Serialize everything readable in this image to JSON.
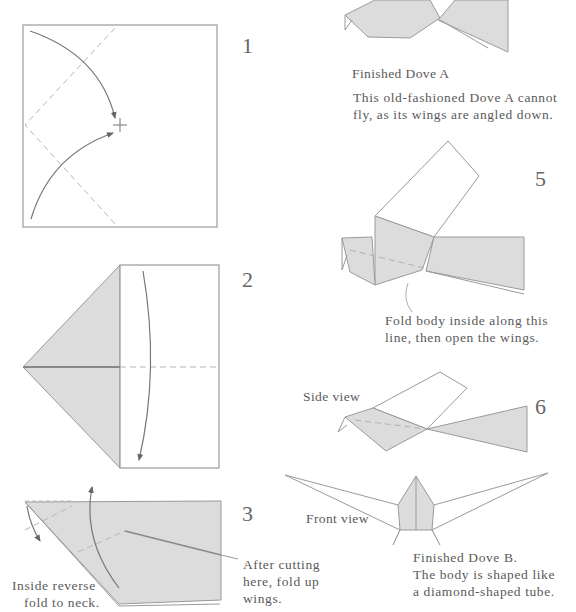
{
  "colors": {
    "paper_fill": "#dcdcdc",
    "line": "#8a8a8a",
    "arrow": "#6a6a6a",
    "dashed": "#b0b0b0",
    "text": "#5a5a5a"
  },
  "steps": [
    {
      "number": "1"
    },
    {
      "number": "2"
    },
    {
      "number": "3",
      "annotations": {
        "left": [
          "Inside reverse",
          "fold to neck."
        ],
        "right": [
          "After cutting",
          "here, fold up",
          "wings."
        ]
      }
    },
    {
      "number": "5",
      "annotation": [
        "Fold body inside along this",
        "line, then open the wings."
      ]
    },
    {
      "number": "6",
      "labels": {
        "side": "Side view",
        "front": "Front view"
      }
    }
  ],
  "dove_a": {
    "title": "Finished Dove A",
    "description": [
      "This old-fashioned Dove A cannot",
      "fly, as its wings are angled down."
    ]
  },
  "dove_b": {
    "title": "Finished Dove B.",
    "description": [
      "The body is shaped like",
      "a diamond-shaped tube."
    ]
  }
}
